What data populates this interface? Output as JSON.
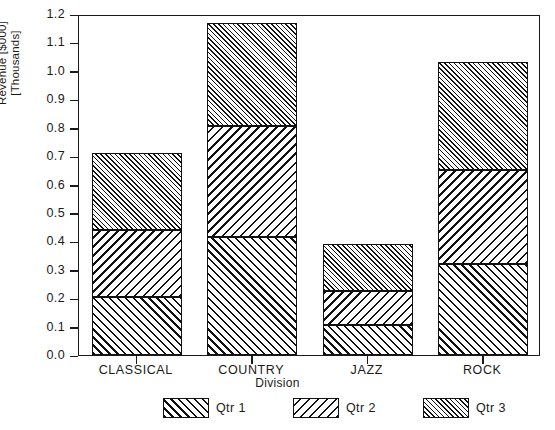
{
  "chart_data": {
    "type": "bar",
    "subtype": "stacked-vertical",
    "title": "",
    "xlabel": "Division",
    "ylabel": "Revenue [$000]\n[Thousands]",
    "categories": [
      "CLASSICAL",
      "COUNTRY",
      "JAZZ",
      "ROCK"
    ],
    "series": [
      {
        "name": "Qtr 1",
        "values": [
          0.205,
          0.415,
          0.105,
          0.32
        ],
        "hatch": "forward-diagonal",
        "color": "#111111"
      },
      {
        "name": "Qtr 2",
        "values": [
          0.235,
          0.39,
          0.12,
          0.33
        ],
        "hatch": "backward-diagonal",
        "color": "#111111"
      },
      {
        "name": "Qtr 3",
        "values": [
          0.27,
          0.365,
          0.165,
          0.38
        ],
        "hatch": "fine-forward-diagonal",
        "color": "#111111"
      }
    ],
    "stack_totals": [
      0.71,
      1.17,
      0.39,
      1.03
    ],
    "stack_boundaries": [
      [
        0.205,
        0.44,
        0.71
      ],
      [
        0.415,
        0.805,
        1.17
      ],
      [
        0.105,
        0.225,
        0.39
      ],
      [
        0.32,
        0.65,
        1.03
      ]
    ],
    "ylim": [
      0.0,
      1.2
    ],
    "ytick_values": [
      0.0,
      0.1,
      0.2,
      0.3,
      0.4,
      0.5,
      0.6,
      0.7,
      0.8,
      0.9,
      1.0,
      1.1,
      1.2
    ],
    "ytick_labels": [
      "0.0",
      "0.1",
      "0.2",
      "0.3",
      "0.4",
      "0.5",
      "0.6",
      "0.7",
      "0.8",
      "0.9",
      "1.0",
      "1.1",
      "1.2"
    ],
    "grid": false,
    "frame": true,
    "legend_position": "bottom",
    "legend_entries": [
      "Qtr 1",
      "Qtr 2",
      "Qtr 3"
    ]
  }
}
